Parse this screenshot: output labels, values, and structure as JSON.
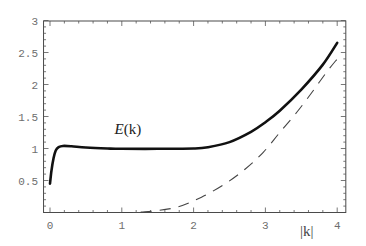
{
  "chart_data": {
    "type": "line",
    "title": "",
    "xlabel": "|k|",
    "ylabel": "",
    "xlim": [
      -0.09,
      4.12
    ],
    "ylim": [
      0,
      3
    ],
    "grid": false,
    "frame": true,
    "x_ticks": [
      0,
      1,
      2,
      3,
      4
    ],
    "x_tick_labels": [
      "0",
      "1",
      "2",
      "3",
      "4"
    ],
    "y_ticks": [
      0.5,
      1,
      1.5,
      2,
      2.5,
      3
    ],
    "y_tick_labels": [
      "0.5",
      "1",
      "1.5",
      "2",
      "2.5",
      "3"
    ],
    "annotations": [
      {
        "text_italic": "E",
        "text_rest": "(k)",
        "x": 0.9,
        "y": 1.3,
        "refers_to": "E(k)"
      }
    ],
    "series": [
      {
        "name": "E(k)",
        "style": "solid",
        "color": "#111111",
        "x": [
          0,
          0.02,
          0.05,
          0.08,
          0.12,
          0.18,
          0.3,
          0.5,
          0.8,
          1.0,
          1.5,
          2.0,
          2.2,
          2.5,
          2.8,
          3.0,
          3.2,
          3.5,
          3.8,
          4.0
        ],
        "y": [
          0.45,
          0.65,
          0.85,
          0.97,
          1.02,
          1.04,
          1.035,
          1.015,
          1.0,
          0.995,
          0.995,
          1.0,
          1.02,
          1.1,
          1.26,
          1.41,
          1.59,
          1.92,
          2.31,
          2.65
        ]
      },
      {
        "name": "dashed reference",
        "style": "dashed",
        "color": "#444444",
        "x": [
          1.0,
          1.32,
          1.76,
          2.11,
          2.44,
          2.72,
          2.97,
          3.2,
          3.44,
          3.67,
          3.85,
          4.0
        ],
        "y": [
          0.0,
          0.01,
          0.08,
          0.24,
          0.45,
          0.68,
          0.94,
          1.25,
          1.57,
          1.91,
          2.19,
          2.4
        ]
      }
    ]
  }
}
